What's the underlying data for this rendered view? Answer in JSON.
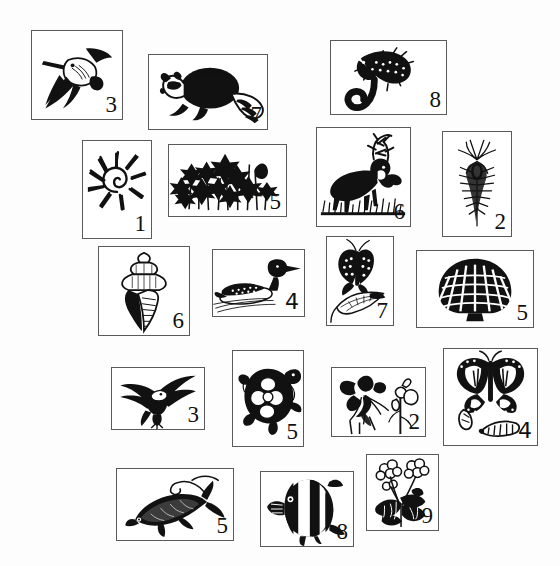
{
  "sheet": {
    "width": 560,
    "height": 566,
    "background": "#fdfdfd",
    "border_color": "#5a5a5a",
    "ink_color": "#111111",
    "description": "Scattered rectangular cards, each with a black-and-white engraving-style nature illustration and a hand-numbered label in the lower right corner"
  },
  "cards": [
    {
      "id": "card-woodpecker",
      "subject": "woodpecker-flying",
      "subject_label": "Woodpecker in flight",
      "number": "3",
      "numeral_style": "serif",
      "x": 31,
      "y": 30,
      "w": 92,
      "h": 90
    },
    {
      "id": "card-raccoon",
      "subject": "raccoon",
      "subject_label": "Raccoon",
      "number": "7",
      "numeral_style": "serif",
      "x": 148,
      "y": 54,
      "w": 120,
      "h": 76
    },
    {
      "id": "card-lizard",
      "subject": "lizard-skink",
      "subject_label": "Lizard / skink",
      "number": "8",
      "numeral_style": "serif",
      "x": 330,
      "y": 40,
      "w": 117,
      "h": 75
    },
    {
      "id": "card-shell-murex",
      "subject": "spiny-sea-shell",
      "subject_label": "Spiny murex sea shell",
      "number": "1",
      "numeral_style": "serif",
      "x": 82,
      "y": 140,
      "w": 70,
      "h": 99
    },
    {
      "id": "card-wildflowers",
      "subject": "wildflowers",
      "subject_label": "Cluster of wildflowers",
      "number": "5",
      "numeral_style": "serif",
      "x": 168,
      "y": 144,
      "w": 119,
      "h": 73
    },
    {
      "id": "card-elk",
      "subject": "elk",
      "subject_label": "Bull elk in grass",
      "number": "6",
      "numeral_style": "serif",
      "x": 316,
      "y": 127,
      "w": 95,
      "h": 100
    },
    {
      "id": "card-thistle",
      "subject": "thistle",
      "subject_label": "Thistle flower head",
      "number": "2",
      "numeral_style": "serif",
      "x": 442,
      "y": 131,
      "w": 70,
      "h": 106
    },
    {
      "id": "card-conch",
      "subject": "conch-shell",
      "subject_label": "Conch / whelk shell",
      "number": "6",
      "numeral_style": "serif",
      "x": 98,
      "y": 246,
      "w": 92,
      "h": 90
    },
    {
      "id": "card-loon",
      "subject": "loon-duck",
      "subject_label": "Loon swimming",
      "number": "4",
      "numeral_style": "handwritten",
      "x": 212,
      "y": 249,
      "w": 93,
      "h": 68
    },
    {
      "id": "card-swallowtail",
      "subject": "swallowtail-butterfly",
      "subject_label": "Swallowtail butterfly on leaf",
      "number": "7",
      "numeral_style": "serif",
      "x": 326,
      "y": 236,
      "w": 68,
      "h": 90
    },
    {
      "id": "card-scallop",
      "subject": "scallop-shell",
      "subject_label": "Scallop shell",
      "number": "5",
      "numeral_style": "serif",
      "x": 416,
      "y": 250,
      "w": 118,
      "h": 78
    },
    {
      "id": "card-eagle",
      "subject": "bald-eagle",
      "subject_label": "Bald eagle in flight",
      "number": "3",
      "numeral_style": "serif",
      "x": 111,
      "y": 367,
      "w": 94,
      "h": 63
    },
    {
      "id": "card-turtle",
      "subject": "turtle",
      "subject_label": "Box turtle",
      "number": "5",
      "numeral_style": "serif",
      "x": 232,
      "y": 350,
      "w": 72,
      "h": 97
    },
    {
      "id": "card-columbine",
      "subject": "columbine-flower",
      "subject_label": "Columbine flower and stem",
      "number": "2",
      "numeral_style": "serif",
      "x": 331,
      "y": 367,
      "w": 95,
      "h": 70
    },
    {
      "id": "card-monarch",
      "subject": "monarch-butterfly",
      "subject_label": "Monarch butterfly with chrysalis and caterpillar",
      "number": "4",
      "numeral_style": "handwritten",
      "x": 443,
      "y": 348,
      "w": 95,
      "h": 98
    },
    {
      "id": "card-trout",
      "subject": "trout-fish",
      "subject_label": "Trout taking a lure",
      "number": "5",
      "numeral_style": "serif",
      "x": 116,
      "y": 468,
      "w": 118,
      "h": 73
    },
    {
      "id": "card-angelfish",
      "subject": "angelfish",
      "subject_label": "Angelfish",
      "number": "8",
      "numeral_style": "serif",
      "x": 260,
      "y": 471,
      "w": 94,
      "h": 76
    },
    {
      "id": "card-geranium",
      "subject": "geranium-plant",
      "subject_label": "Geranium in bloom",
      "number": "9",
      "numeral_style": "serif",
      "x": 366,
      "y": 454,
      "w": 73,
      "h": 77
    }
  ]
}
